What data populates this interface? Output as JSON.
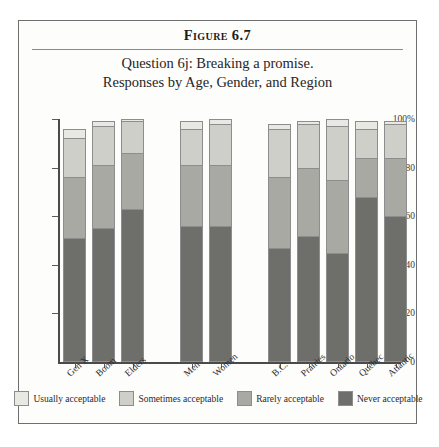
{
  "figure": {
    "number_label": "Figure 6.7",
    "caption_line1": "Question 6j: Breaking a promise.",
    "caption_line2": "Responses by Age, Gender, and Region"
  },
  "colors": {
    "usually": "#e9e9e4",
    "sometimes": "#cfcfc9",
    "rarely": "#a9a9a3",
    "never": "#6e6e6a",
    "axis": "#4a4a4a",
    "frame": "#6f6f6f",
    "text": "#2b2b2b"
  },
  "legend": {
    "items": [
      {
        "label": "Usually acceptable",
        "color": "#e9e9e4"
      },
      {
        "label": "Sometimes acceptable",
        "color": "#cfcfc9"
      },
      {
        "label": "Rarely acceptable",
        "color": "#a9a9a3"
      },
      {
        "label": "Never acceptable",
        "color": "#6e6e6a"
      }
    ]
  },
  "chart_data": {
    "type": "bar",
    "subtype": "stacked-bar-100",
    "title": "Question 6j: Breaking a promise.",
    "subtitle": "Responses by Age, Gender, and Region",
    "xlabel": "",
    "ylabel": "",
    "ylim": [
      0,
      100
    ],
    "yticks": [
      0,
      20,
      40,
      60,
      80,
      100
    ],
    "ytick_labels": [
      "0",
      "20",
      "40",
      "60",
      "80",
      "100%"
    ],
    "grid": false,
    "legend_position": "bottom",
    "stack_order_bottom_to_top": [
      "Never acceptable",
      "Rarely acceptable",
      "Sometimes acceptable",
      "Usually acceptable"
    ],
    "groups": [
      {
        "name": "Age",
        "categories": [
          "Gen X",
          "Boom",
          "Elders"
        ]
      },
      {
        "name": "Gender",
        "categories": [
          "Men",
          "Women"
        ]
      },
      {
        "name": "Region",
        "categories": [
          "B.C.",
          "Prairies",
          "Ontario",
          "Québec",
          "Atlantic"
        ]
      }
    ],
    "categories": [
      "Gen X",
      "Boom",
      "Elders",
      "Men",
      "Women",
      "B.C.",
      "Prairies",
      "Ontario",
      "Québec",
      "Atlantic"
    ],
    "series": [
      {
        "name": "Never acceptable",
        "color": "#6e6e6a",
        "values": [
          51,
          55,
          63,
          56,
          56,
          47,
          52,
          45,
          68,
          60
        ]
      },
      {
        "name": "Rarely acceptable",
        "color": "#a9a9a3",
        "values": [
          25,
          26,
          23,
          25,
          25,
          29,
          28,
          30,
          16,
          24
        ]
      },
      {
        "name": "Sometimes acceptable",
        "color": "#cfcfc9",
        "values": [
          16,
          16,
          13,
          15,
          17,
          20,
          18,
          22,
          12,
          14
        ]
      },
      {
        "name": "Usually acceptable",
        "color": "#e9e9e4",
        "values": [
          4,
          2,
          1,
          3,
          2,
          2,
          1,
          3,
          3,
          1
        ]
      }
    ],
    "bar_totals": [
      96,
      99,
      100,
      99,
      100,
      98,
      99,
      100,
      99,
      99
    ]
  }
}
